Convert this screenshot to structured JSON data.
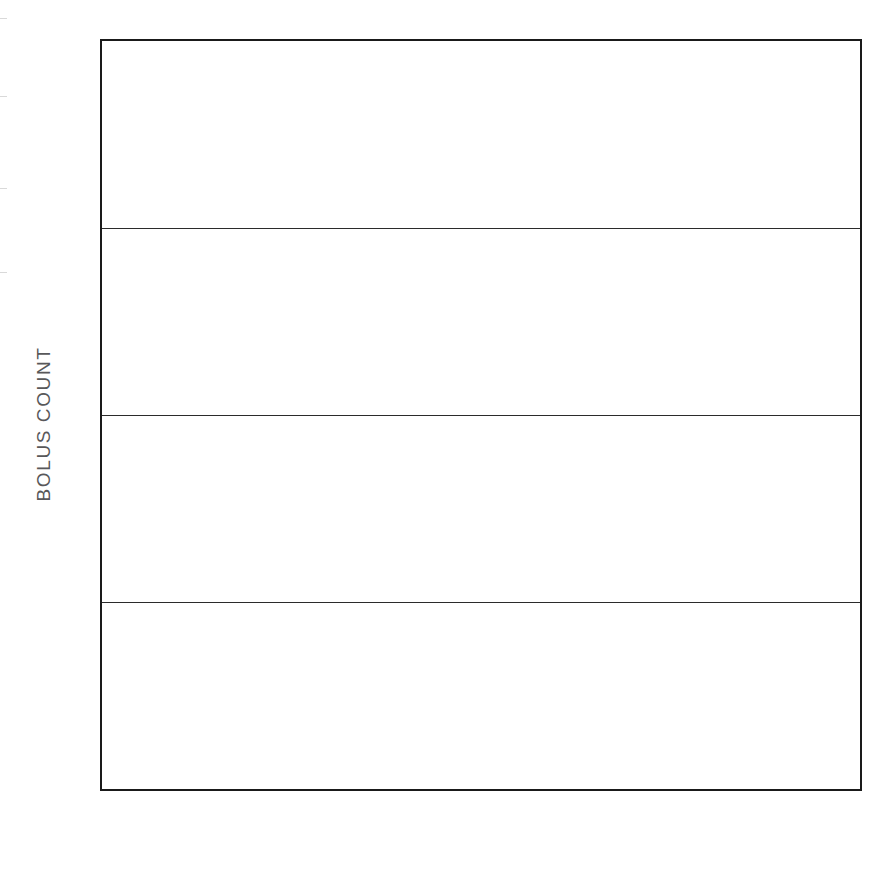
{
  "chart_data": {
    "type": "bar",
    "title": "",
    "subtitle": "",
    "xlabel": "",
    "ylabel": "BOLUS COUNT",
    "categories": [
      "UNTREATED",
      "PLACEBO",
      "TESTOSTERONE"
    ],
    "series": [
      {
        "name": "MALES",
        "color": "#111111",
        "values": [
          14.0,
          16.2,
          14.2
        ]
      },
      {
        "name": "FEMALES",
        "color": "#b4b4b4",
        "values": [
          9.3,
          11.6,
          14.6
        ]
      }
    ],
    "ylim": [
      0,
      20
    ],
    "yticks": [
      0,
      5,
      10,
      15,
      20
    ],
    "ytick_labels": [
      "0",
      "5",
      "10",
      "15",
      "20"
    ],
    "grid": true,
    "grid_axis": "y",
    "legend_position": "bottom-left",
    "legend_entries": [
      {
        "label": "MALES",
        "color": "#111111"
      },
      {
        "label": "FEMALES",
        "color": "#b4b4b4"
      }
    ],
    "bar_group_order": [
      "MALES",
      "FEMALES"
    ]
  },
  "axis": {
    "y_title": "BOLUS COUNT",
    "ticks": [
      {
        "value": 20,
        "label": "20"
      },
      {
        "value": 15,
        "label": "15"
      },
      {
        "value": 10,
        "label": "10"
      },
      {
        "value": 5,
        "label": "5"
      },
      {
        "value": 0,
        "label": "0"
      }
    ]
  },
  "categories": [
    {
      "label": "UNTREATED"
    },
    {
      "label": "PLACEBO"
    },
    {
      "label": "TESTOSTERONE"
    }
  ],
  "legend": {
    "males_label": "MALES",
    "females_label": "FEMALES"
  }
}
